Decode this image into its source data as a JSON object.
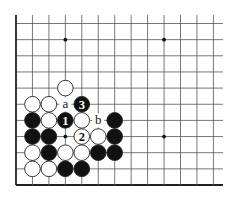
{
  "diagram": {
    "type": "go-board-fragment",
    "grid": {
      "origin_x": 16,
      "origin_y": 23.5,
      "col_spacing": 16.45,
      "row_spacing": 16.15,
      "columns": 13,
      "rows": 11,
      "line_top": 15,
      "line_right": 223,
      "left_edge": true,
      "bottom_edge": true,
      "line_color": "#555555",
      "edge_color": "#222222"
    },
    "star_points": [
      {
        "col": 3,
        "row": 1
      },
      {
        "col": 9,
        "row": 1
      },
      {
        "col": 3,
        "row": 7
      },
      {
        "col": 9,
        "row": 7
      }
    ],
    "stones": [
      {
        "col": 3,
        "row": 4,
        "color": "white",
        "label": ""
      },
      {
        "col": 1,
        "row": 5,
        "color": "white",
        "label": ""
      },
      {
        "col": 2,
        "row": 5,
        "color": "white",
        "label": ""
      },
      {
        "col": 4,
        "row": 5,
        "color": "black",
        "label": "3"
      },
      {
        "col": 1,
        "row": 6,
        "color": "black",
        "label": ""
      },
      {
        "col": 2,
        "row": 6,
        "color": "white",
        "label": ""
      },
      {
        "col": 3,
        "row": 6,
        "color": "black",
        "label": "1"
      },
      {
        "col": 4,
        "row": 6,
        "color": "white",
        "label": ""
      },
      {
        "col": 6,
        "row": 6,
        "color": "black",
        "label": ""
      },
      {
        "col": 1,
        "row": 7,
        "color": "black",
        "label": ""
      },
      {
        "col": 2,
        "row": 7,
        "color": "black",
        "label": ""
      },
      {
        "col": 4,
        "row": 7,
        "color": "white",
        "label": "2"
      },
      {
        "col": 5,
        "row": 7,
        "color": "white",
        "label": ""
      },
      {
        "col": 6,
        "row": 7,
        "color": "black",
        "label": ""
      },
      {
        "col": 1,
        "row": 8,
        "color": "white",
        "label": ""
      },
      {
        "col": 2,
        "row": 8,
        "color": "black",
        "label": ""
      },
      {
        "col": 3,
        "row": 8,
        "color": "white",
        "label": ""
      },
      {
        "col": 4,
        "row": 8,
        "color": "white",
        "label": ""
      },
      {
        "col": 5,
        "row": 8,
        "color": "black",
        "label": ""
      },
      {
        "col": 6,
        "row": 8,
        "color": "black",
        "label": ""
      },
      {
        "col": 1,
        "row": 9,
        "color": "white",
        "label": ""
      },
      {
        "col": 2,
        "row": 9,
        "color": "white",
        "label": ""
      },
      {
        "col": 3,
        "row": 9,
        "color": "black",
        "label": ""
      },
      {
        "col": 4,
        "row": 9,
        "color": "black",
        "label": ""
      }
    ],
    "point_labels": [
      {
        "col": 3,
        "row": 5,
        "text": "a"
      },
      {
        "col": 5,
        "row": 6,
        "text": "b"
      }
    ],
    "colors": {
      "black_stone": "#111111",
      "white_stone": "#ffffff",
      "stone_outline": "#222222",
      "label_on_black": "#ffffff",
      "label_on_white": "#111111",
      "background": "#ffffff"
    }
  }
}
